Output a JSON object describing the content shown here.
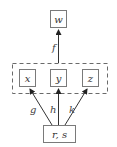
{
  "diagram": {
    "nodes": {
      "w": {
        "label": "w"
      },
      "x": {
        "label": "x"
      },
      "y": {
        "label": "y"
      },
      "z": {
        "label": "z"
      },
      "rs": {
        "label": "r, s"
      }
    },
    "group": {
      "members": [
        "x",
        "y",
        "z"
      ],
      "style": "dashed"
    },
    "edges": [
      {
        "from": "group",
        "to": "w",
        "label": "f"
      },
      {
        "from": "rs",
        "to": "x",
        "label": "g"
      },
      {
        "from": "rs",
        "to": "y",
        "label": "h"
      },
      {
        "from": "rs",
        "to": "z",
        "label": "k"
      }
    ],
    "edge_labels": {
      "f": "f",
      "g": "g",
      "h": "h",
      "k": "k"
    }
  }
}
